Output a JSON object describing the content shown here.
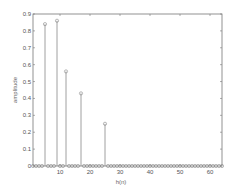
{
  "chart_data": {
    "type": "stem",
    "title": "",
    "xlabel": "h(n)",
    "ylabel": "amplitude",
    "xlim": [
      1,
      64
    ],
    "ylim": [
      0,
      0.9
    ],
    "xticks": [
      10,
      20,
      30,
      40,
      50,
      60
    ],
    "yticks": [
      0,
      0.1,
      0.2,
      0.3,
      0.4,
      0.5,
      0.6,
      0.7,
      0.8,
      0.9
    ],
    "ytick_labels": [
      "0",
      "0.1",
      "0.2",
      "0.3",
      "0.4",
      "0.5",
      "0.6",
      "0.7",
      "0.8",
      "0.9"
    ],
    "xtick_labels": [
      "10",
      "20",
      "30",
      "40",
      "50",
      "60"
    ],
    "grid": false,
    "legend": null,
    "nonzero_points": [
      {
        "n": 5,
        "value": 0.84
      },
      {
        "n": 9,
        "value": 0.86
      },
      {
        "n": 12,
        "value": 0.56
      },
      {
        "n": 17,
        "value": 0.43
      },
      {
        "n": 25,
        "value": 0.25
      }
    ],
    "baseline_value": 0,
    "n_range": [
      1,
      64
    ],
    "colors": {
      "stem": "#888888",
      "axis": "#777777",
      "background": "#ffffff"
    }
  }
}
